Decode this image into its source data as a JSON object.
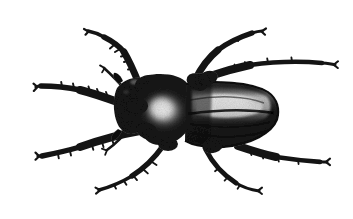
{
  "image": {
    "kind": "natural-photograph",
    "subject": "beetle",
    "subject_common_name": "beetle (longhorn / stag-beetle type)",
    "view": "dorsal (top-down)",
    "orientation": "head at left, abdomen at right",
    "medium": "grainy halftone black-and-white photograph",
    "background_color": "#ffffff",
    "body_color": "#1a1a1a",
    "midtone_color": "#4a4a4a",
    "highlight_color": "#e8e8e8",
    "width_px": 353,
    "height_px": 219,
    "caption": ""
  },
  "anatomy": {
    "parts": [
      {
        "name": "head",
        "label": "Head",
        "center_x": 128,
        "center_y": 100
      },
      {
        "name": "pronotum",
        "label": "Pronotum (thorax)",
        "center_x": 163,
        "center_y": 112,
        "note": "bright specular highlight"
      },
      {
        "name": "elytra",
        "label": "Elytra (wing covers)",
        "center_x": 232,
        "center_y": 114,
        "note": "pale longitudinal stripe along upper half"
      },
      {
        "name": "abdomen-tip",
        "label": "Abdomen tip",
        "center_x": 277,
        "center_y": 114
      }
    ],
    "legs": [
      {
        "name": "foreleg-left",
        "label": "Front left leg",
        "direction": "upper-left",
        "tip_x": 88,
        "tip_y": 30
      },
      {
        "name": "midleg-left",
        "label": "Middle left leg",
        "direction": "left",
        "tip_x": 36,
        "tip_y": 87
      },
      {
        "name": "hindleg-left",
        "label": "Hind left leg",
        "direction": "lower-left",
        "tip_x": 38,
        "tip_y": 155
      },
      {
        "name": "foreleg-right",
        "label": "Front right leg",
        "direction": "upper-right",
        "tip_x": 262,
        "tip_y": 31
      },
      {
        "name": "midleg-right",
        "label": "Middle right leg",
        "direction": "right",
        "tip_x": 336,
        "tip_y": 65
      },
      {
        "name": "hindleg-right",
        "label": "Hind right leg",
        "direction": "lower-right",
        "tip_x": 327,
        "tip_y": 162
      }
    ],
    "extra_appendages": [
      {
        "name": "palp-left",
        "label": "Left palp / small appendage",
        "tip_x": 100,
        "tip_y": 65
      },
      {
        "name": "palp-lower-left",
        "label": "Lower left palp",
        "tip_x": 102,
        "tip_y": 152
      },
      {
        "name": "tarsus-lower-center",
        "label": "Lower center tarsus",
        "tip_x": 98,
        "tip_y": 190
      },
      {
        "name": "tarsus-lower-right",
        "label": "Lower right tarsus",
        "tip_x": 258,
        "tip_y": 190
      }
    ]
  }
}
